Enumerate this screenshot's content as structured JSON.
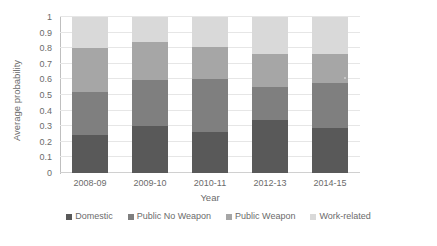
{
  "chart_data": {
    "type": "bar",
    "subtype": "stacked-bar",
    "title": "",
    "xlabel": "Year",
    "ylabel": "Average probability",
    "categories": [
      "2008-09",
      "2009-10",
      "2010-11",
      "2012-13",
      "2014-15"
    ],
    "ylim": [
      0,
      1
    ],
    "ytick_labels": [
      "0",
      "0.1",
      "0.2",
      "0.3",
      "0.4",
      "0.5",
      "0.6",
      "0.7",
      "0.8",
      "0.9",
      "1"
    ],
    "ytick_values": [
      0,
      0.1,
      0.2,
      0.3,
      0.4,
      0.5,
      0.6,
      0.7,
      0.8,
      0.9,
      1
    ],
    "grid": true,
    "grid_axis": "y",
    "legend_position": "bottom",
    "stacked_total": 1.0,
    "series": [
      {
        "name": "Domestic",
        "color": "#595959",
        "values": [
          0.245,
          0.3,
          0.265,
          0.34,
          0.29
        ]
      },
      {
        "name": "Public No Weapon",
        "color": "#7f7f7f",
        "values": [
          0.275,
          0.295,
          0.335,
          0.21,
          0.285
        ]
      },
      {
        "name": "Public Weapon",
        "color": "#a6a6a6",
        "values": [
          0.28,
          0.245,
          0.21,
          0.215,
          0.185
        ]
      },
      {
        "name": "Work-related",
        "color": "#d9d9d9",
        "values": [
          0.2,
          0.16,
          0.19,
          0.235,
          0.24
        ]
      }
    ],
    "cumulative_tops": [
      [
        0.245,
        0.52,
        0.8,
        1.0
      ],
      [
        0.3,
        0.595,
        0.84,
        1.0
      ],
      [
        0.265,
        0.6,
        0.81,
        1.0
      ],
      [
        0.34,
        0.55,
        0.765,
        1.0
      ],
      [
        0.29,
        0.575,
        0.76,
        1.0
      ]
    ]
  },
  "legend": {
    "items": [
      {
        "label": "Domestic"
      },
      {
        "label": "Public No Weapon"
      },
      {
        "label": "Public Weapon"
      },
      {
        "label": "Work-related"
      }
    ]
  }
}
